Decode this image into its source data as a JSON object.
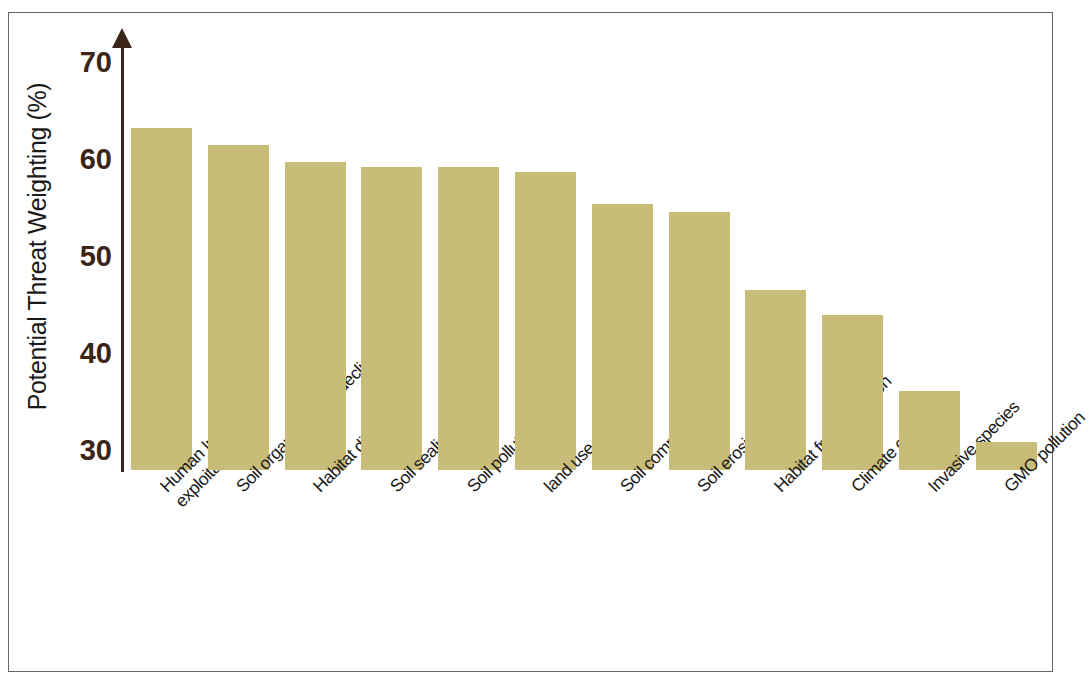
{
  "figure": {
    "background_color": "#ffffff",
    "frame_color": "#6b645f",
    "axis_color": "#3b2418",
    "bar_color": "#c8bd78",
    "tick_label_color": "#3b2418",
    "axis_title_color": "#1a1a1a"
  },
  "axis": {
    "y_title": "Potential Threat Weighting (%)",
    "y_ticks": [
      "70",
      "60",
      "50",
      "40",
      "30"
    ],
    "x_title": ""
  },
  "chart_data": {
    "type": "bar",
    "title": "",
    "xlabel": "",
    "ylabel": "Potential Threat Weighting (%)",
    "ylim": [
      27,
      72
    ],
    "yticks": [
      30,
      40,
      50,
      60,
      70
    ],
    "grid": false,
    "legend": false,
    "orientation": "vertical",
    "bar_color": "#c8bd78",
    "categories": [
      "Human Intensive\nexploitation",
      "Soil organic matter decline",
      "Habitat disruption",
      "Soil sealing",
      "Soil pollution",
      "land use change",
      "Soil compaction",
      "Soil erosion",
      "Habitat fragmentation",
      "Climate change",
      "Invasive species",
      "GMO pollution"
    ],
    "values": [
      63.2,
      61.4,
      59.7,
      59.2,
      59.2,
      58.7,
      55.4,
      54.5,
      46.5,
      43.9,
      36.1,
      30.8
    ]
  }
}
